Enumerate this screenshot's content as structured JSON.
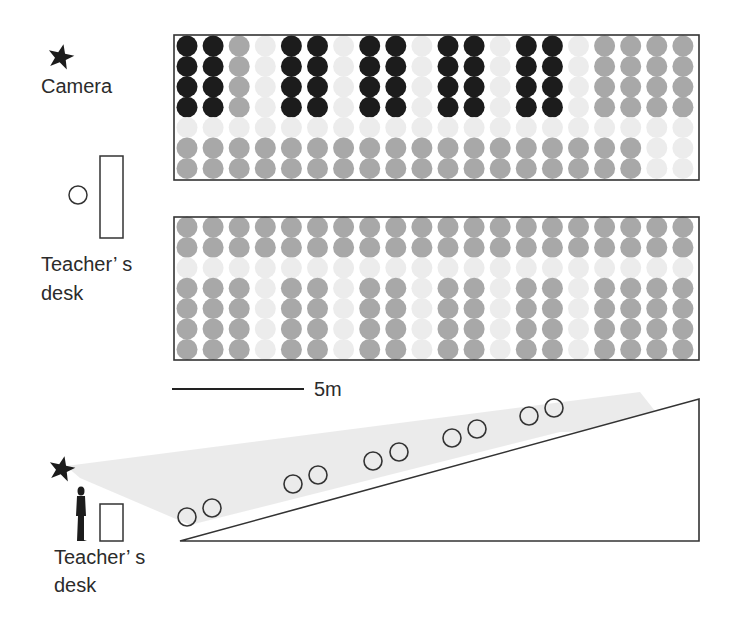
{
  "labels": {
    "camera": "Camera",
    "teacher_desk_line1": "Teacher’ s",
    "teacher_desk_line2": "desk",
    "side_teacher_desk_line1": "Teacher’ s",
    "side_teacher_desk_line2": "desk",
    "scale": "5m"
  },
  "colors": {
    "black": "#1c1c1c",
    "gray": "#a8a8a8",
    "light": "#ececec",
    "line": "#333333",
    "cone": "#e6e6e6"
  },
  "legend_codes": {
    "B": "black",
    "G": "gray",
    "L": "light"
  },
  "top_block": {
    "columns": 20,
    "rows": [
      "BBGLBBLBBLBBLBBLGGGG",
      "BBGLBBLBBLBBLBBLGGGG",
      "BBGLBBLBBLBBLBBLGGGG",
      "BBGLBBLBBLBBLBBLGGGG",
      "LLLLLLLLLLLLLLLLLLLL",
      "GGGGGGGGGGGGGGGGGGLL",
      "GGGGGGGGGGGGGGGGGGLL"
    ]
  },
  "middle_block": {
    "columns": 20,
    "rows": [
      "GGGGGGGGGGGGGGGGGGGG",
      "GGGGGGGGGGGGGGGGGGGG",
      "LLLLLLLLLLLLLLLLLLLL",
      "GGGLGGLGGLGGLGGLGGGG",
      "GGGLGGLGGLGGLGGLGGGG",
      "GGGLGGLGGLGGLGGLGGGG",
      "GGGLGGLGGLGGLGGLGGGG"
    ]
  },
  "side_view": {
    "seat_pairs": 5,
    "students": [
      [
        187,
        517
      ],
      [
        212,
        508
      ],
      [
        293,
        484
      ],
      [
        318,
        475
      ],
      [
        373,
        461
      ],
      [
        399,
        452
      ],
      [
        452,
        438
      ],
      [
        477,
        429
      ],
      [
        529,
        416
      ],
      [
        554,
        408
      ]
    ]
  }
}
